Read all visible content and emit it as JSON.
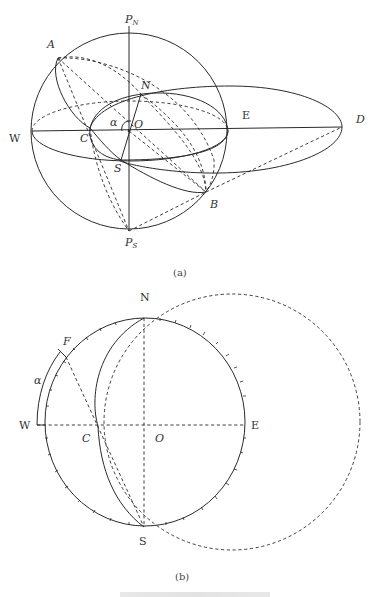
{
  "figure_a": {
    "subcaption": "(a)",
    "labels": {
      "pole_north": "P",
      "pole_north_sub": "N",
      "pole_south": "P",
      "pole_south_sub": "S",
      "A": "A",
      "B": "B",
      "C": "C",
      "D": "D",
      "N": "N",
      "S": "S",
      "O": "O",
      "W": "W",
      "E": "E",
      "alpha": "α"
    }
  },
  "figure_b": {
    "subcaption": "(b)",
    "labels": {
      "N": "N",
      "S": "S",
      "W": "W",
      "E": "E",
      "C": "C",
      "O": "O",
      "F": "F",
      "alpha": "α"
    }
  },
  "colors": {
    "line": "#2a2a2a",
    "text": "#333333",
    "background": "#ffffff"
  }
}
